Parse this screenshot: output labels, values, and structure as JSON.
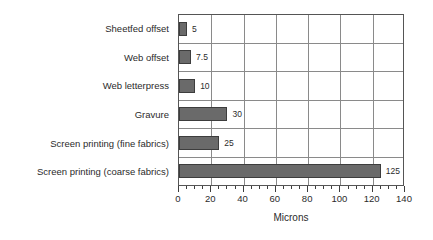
{
  "chart_data": {
    "type": "bar",
    "orientation": "horizontal",
    "title": "",
    "subtitle": "",
    "xlabel": "Microns",
    "ylabel": "",
    "xlim": [
      0,
      140
    ],
    "xticks": [
      0,
      20,
      40,
      60,
      80,
      100,
      120,
      140
    ],
    "xtick_labels": [
      "0",
      "20",
      "40",
      "60",
      "80",
      "100",
      "120",
      "140"
    ],
    "minor_tick_step": 5,
    "grid": true,
    "grid_axis": "x",
    "legend": false,
    "legend_position": "none",
    "categories": [
      "Sheetfed offset",
      "Web offset",
      "Web letterpress",
      "Gravure",
      "Screen printing (fine fabrics)",
      "Screen printing (coarse fabrics)"
    ],
    "values": [
      5,
      7.5,
      10,
      30,
      25,
      125
    ],
    "value_labels": [
      "5",
      "7.5",
      "10",
      "30",
      "25",
      "125"
    ],
    "bar_color": "#6a6a6a",
    "bar_edge_color": "#3d3d3d",
    "grid_color": "#8a8a8a",
    "axis_color": "#555555",
    "background_color": "#ffffff"
  }
}
